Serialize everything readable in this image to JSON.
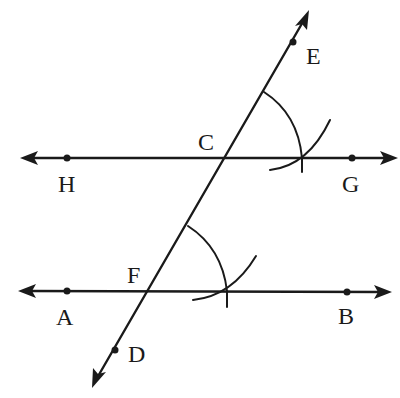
{
  "diagram": {
    "colors": {
      "ink": "#1a1a1a",
      "background": "#ffffff"
    },
    "points": {
      "A": {
        "label": "A",
        "x": 67,
        "y": 291
      },
      "B": {
        "label": "B",
        "x": 347,
        "y": 292
      },
      "C": {
        "label": "C",
        "x": 223,
        "y": 158
      },
      "D": {
        "label": "D",
        "x": 115,
        "y": 350
      },
      "E": {
        "label": "E",
        "x": 293,
        "y": 42
      },
      "F": {
        "label": "F",
        "x": 149,
        "y": 291
      },
      "G": {
        "label": "G",
        "x": 352,
        "y": 158
      },
      "H": {
        "label": "H",
        "x": 67,
        "y": 158
      }
    },
    "lines": [
      {
        "id": "line-HG",
        "through": [
          "H",
          "G"
        ],
        "arrows": "both"
      },
      {
        "id": "line-AB",
        "through": [
          "A",
          "B"
        ],
        "arrows": "both"
      },
      {
        "id": "line-DE",
        "through": [
          "D",
          "E"
        ],
        "arrows": "both",
        "transversal": true
      }
    ],
    "arcs": [
      {
        "id": "arc-at-F",
        "center": "F",
        "description": "angle arc from FE to FB"
      },
      {
        "id": "arc-cross-F",
        "description": "small compass arc intersecting FB"
      },
      {
        "id": "arc-at-C",
        "center": "C",
        "description": "angle arc from CE to CG"
      },
      {
        "id": "arc-cross-C",
        "description": "small compass arc intersecting CG"
      }
    ],
    "labels": [
      "A",
      "B",
      "C",
      "D",
      "E",
      "F",
      "G",
      "H"
    ]
  }
}
